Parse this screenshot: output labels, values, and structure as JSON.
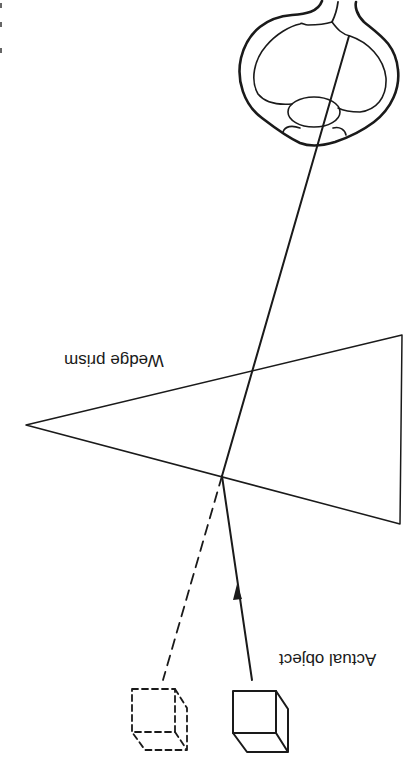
{
  "diagram": {
    "orientation": "rotated 180 degrees",
    "labels": {
      "prism": "Wedge prism",
      "object": "Actual object"
    },
    "elements": [
      {
        "id": "eye",
        "description": "Cross-section of the eye with lens and optic nerve"
      },
      {
        "id": "wedge-prism",
        "description": "Triangular wedge prism with apex pointing left"
      },
      {
        "id": "light-ray",
        "description": "Solid ray from actual object refracted by prism into eye, arrow pointing toward prism"
      },
      {
        "id": "projected-ray",
        "description": "Dashed line showing apparent direction of object"
      },
      {
        "id": "actual-object",
        "description": "Solid-line cube"
      },
      {
        "id": "apparent-object",
        "description": "Dashed-line cube (perceived image)"
      }
    ],
    "colors": {
      "line": "#1a1a1a",
      "background": "#ffffff"
    }
  }
}
